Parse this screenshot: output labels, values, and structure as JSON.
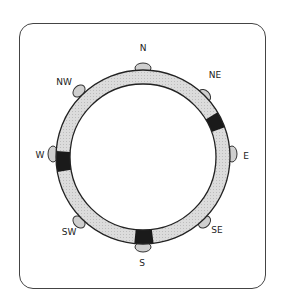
{
  "diagram": {
    "type": "compass-ring",
    "labels": {
      "n": "N",
      "ne": "NE",
      "e": "E",
      "se": "SE",
      "s": "S",
      "sw": "SW",
      "w": "W",
      "nw": "NW"
    },
    "colors": {
      "ring_fill": "#d9d9d9",
      "stroke": "#222222",
      "marked_segment": "#1a1a1a",
      "knob_fill": "#cfcfcf"
    },
    "marked_segments": [
      "between NE and E",
      "W",
      "S"
    ]
  }
}
